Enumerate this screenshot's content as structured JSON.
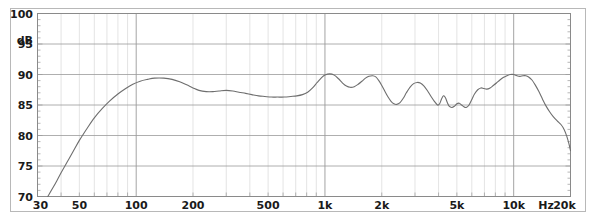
{
  "chart_data": {
    "type": "line",
    "title": "",
    "subtitle": "",
    "xlabel": "Hz",
    "ylabel": "dB",
    "xscale": "log",
    "yscale": "linear",
    "xlim": [
      30,
      20000
    ],
    "ylim": [
      70,
      100
    ],
    "grid": true,
    "legend": null,
    "x_tick_labels": [
      "30",
      "50",
      "100",
      "200",
      "500",
      "1k",
      "2k",
      "5k",
      "10k",
      "20k"
    ],
    "x_tick_values": [
      30,
      50,
      100,
      200,
      500,
      1000,
      2000,
      5000,
      10000,
      20000
    ],
    "y_tick_labels": [
      "70",
      "75",
      "80",
      "85",
      "90",
      "95",
      "100"
    ],
    "y_tick_values": [
      70,
      75,
      80,
      85,
      90,
      95,
      100
    ],
    "series": [
      {
        "name": "frequency-response",
        "color": "#6e6e6e",
        "points": [
          [
            34.0,
            70.0
          ],
          [
            36.0,
            71.3
          ],
          [
            38.0,
            72.6
          ],
          [
            40.0,
            73.9
          ],
          [
            43.0,
            75.6
          ],
          [
            46.0,
            77.2
          ],
          [
            50.0,
            79.2
          ],
          [
            55.0,
            81.2
          ],
          [
            60.0,
            82.9
          ],
          [
            66.0,
            84.4
          ],
          [
            72.0,
            85.6
          ],
          [
            80.0,
            86.8
          ],
          [
            88.0,
            87.7
          ],
          [
            96.0,
            88.4
          ],
          [
            105.0,
            88.9
          ],
          [
            115.0,
            89.2
          ],
          [
            125.0,
            89.4
          ],
          [
            140.0,
            89.4
          ],
          [
            155.0,
            89.2
          ],
          [
            170.0,
            88.8
          ],
          [
            185.0,
            88.3
          ],
          [
            200.0,
            87.8
          ],
          [
            215.0,
            87.4
          ],
          [
            235.0,
            87.2
          ],
          [
            255.0,
            87.2
          ],
          [
            275.0,
            87.3
          ],
          [
            300.0,
            87.4
          ],
          [
            325.0,
            87.3
          ],
          [
            350.0,
            87.1
          ],
          [
            380.0,
            86.9
          ],
          [
            410.0,
            86.7
          ],
          [
            445.0,
            86.5
          ],
          [
            480.0,
            86.4
          ],
          [
            520.0,
            86.3
          ],
          [
            560.0,
            86.3
          ],
          [
            610.0,
            86.3
          ],
          [
            660.0,
            86.4
          ],
          [
            710.0,
            86.5
          ],
          [
            760.0,
            86.7
          ],
          [
            810.0,
            87.1
          ],
          [
            860.0,
            87.8
          ],
          [
            910.0,
            88.7
          ],
          [
            960.0,
            89.5
          ],
          [
            1000.0,
            89.9
          ],
          [
            1060.0,
            90.1
          ],
          [
            1120.0,
            89.9
          ],
          [
            1180.0,
            89.3
          ],
          [
            1240.0,
            88.6
          ],
          [
            1300.0,
            88.1
          ],
          [
            1360.0,
            87.9
          ],
          [
            1430.0,
            88.0
          ],
          [
            1500.0,
            88.4
          ],
          [
            1570.0,
            88.9
          ],
          [
            1640.0,
            89.4
          ],
          [
            1710.0,
            89.7
          ],
          [
            1790.0,
            89.8
          ],
          [
            1860.0,
            89.6
          ],
          [
            1930.0,
            89.0
          ],
          [
            2000.0,
            88.2
          ],
          [
            2080.0,
            87.2
          ],
          [
            2160.0,
            86.3
          ],
          [
            2240.0,
            85.6
          ],
          [
            2320.0,
            85.2
          ],
          [
            2400.0,
            85.1
          ],
          [
            2500.0,
            85.4
          ],
          [
            2600.0,
            86.1
          ],
          [
            2700.0,
            87.0
          ],
          [
            2820.0,
            87.9
          ],
          [
            2950.0,
            88.5
          ],
          [
            3080.0,
            88.7
          ],
          [
            3200.0,
            88.6
          ],
          [
            3350.0,
            88.1
          ],
          [
            3500.0,
            87.3
          ],
          [
            3650.0,
            86.4
          ],
          [
            3800.0,
            85.6
          ],
          [
            3950.0,
            85.0
          ],
          [
            4050.0,
            85.2
          ],
          [
            4150.0,
            86.0
          ],
          [
            4250.0,
            86.5
          ],
          [
            4350.0,
            86.2
          ],
          [
            4450.0,
            85.4
          ],
          [
            4550.0,
            84.8
          ],
          [
            4700.0,
            84.6
          ],
          [
            4850.0,
            84.8
          ],
          [
            5000.0,
            85.2
          ],
          [
            5150.0,
            85.3
          ],
          [
            5300.0,
            85.0
          ],
          [
            5450.0,
            84.7
          ],
          [
            5600.0,
            84.6
          ],
          [
            5800.0,
            85.0
          ],
          [
            6000.0,
            85.9
          ],
          [
            6200.0,
            86.8
          ],
          [
            6450.0,
            87.5
          ],
          [
            6700.0,
            87.8
          ],
          [
            6950.0,
            87.7
          ],
          [
            7200.0,
            87.6
          ],
          [
            7500.0,
            87.8
          ],
          [
            7800.0,
            88.2
          ],
          [
            8100.0,
            88.6
          ],
          [
            8450.0,
            89.1
          ],
          [
            8800.0,
            89.5
          ],
          [
            9200.0,
            89.8
          ],
          [
            9600.0,
            90.0
          ],
          [
            10000.0,
            90.0
          ],
          [
            10400.0,
            89.8
          ],
          [
            10800.0,
            89.7
          ],
          [
            11200.0,
            89.8
          ],
          [
            11600.0,
            89.8
          ],
          [
            12000.0,
            89.6
          ],
          [
            12500.0,
            89.1
          ],
          [
            13000.0,
            88.3
          ],
          [
            13600.0,
            87.2
          ],
          [
            14200.0,
            86.0
          ],
          [
            14800.0,
            84.9
          ],
          [
            15500.0,
            83.9
          ],
          [
            16200.0,
            83.1
          ],
          [
            17000.0,
            82.4
          ],
          [
            17800.0,
            81.8
          ],
          [
            18500.0,
            81.0
          ],
          [
            19100.0,
            79.9
          ],
          [
            19600.0,
            78.7
          ],
          [
            20000.0,
            77.5
          ]
        ]
      }
    ]
  },
  "style": {
    "plot_border_color": "#8a8a8a",
    "outer_border_color": "#b0b0b0",
    "major_grid_color": "#9a9a9a",
    "minor_grid_color": "#d8d8d8",
    "curve_color": "#6e6e6e",
    "text_color": "#1a1a1a",
    "background_color": "#ffffff"
  }
}
